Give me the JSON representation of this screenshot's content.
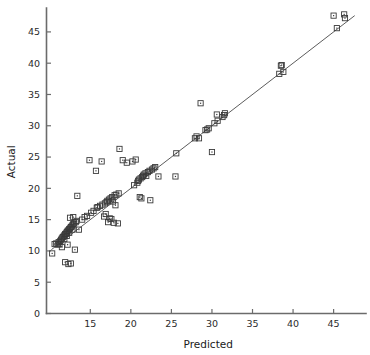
{
  "chart_data": {
    "type": "scatter",
    "title": "",
    "xlabel": "Predicted",
    "ylabel": "Actual",
    "xlim": [
      9.6,
      48.5
    ],
    "ylim": [
      0,
      48.5
    ],
    "xticks": [
      15,
      20,
      25,
      30,
      35,
      40,
      45
    ],
    "yticks": [
      0,
      5,
      10,
      15,
      20,
      25,
      30,
      35,
      40,
      45
    ],
    "xtick_labels": [
      "15",
      "20",
      "25",
      "30",
      "35",
      "40",
      "45"
    ],
    "ytick_labels": [
      "0",
      "5",
      "10",
      "15",
      "20",
      "25",
      "30",
      "35",
      "40",
      "45"
    ],
    "grid": false,
    "legend": null,
    "marker": "open-square-with-center-dot",
    "marker_color": "#3a3a3a",
    "reference_line": {
      "name": "identity-line",
      "type": "line",
      "x": [
        10.2,
        47.6
      ],
      "y": [
        10.2,
        47.6
      ],
      "color": "#4a4a4a"
    },
    "points": [
      {
        "x": 10.3,
        "y": 9.6
      },
      {
        "x": 10.6,
        "y": 11.1
      },
      {
        "x": 10.8,
        "y": 11.2
      },
      {
        "x": 11.0,
        "y": 11.0
      },
      {
        "x": 11.1,
        "y": 11.4
      },
      {
        "x": 11.2,
        "y": 11.1
      },
      {
        "x": 11.3,
        "y": 11.6
      },
      {
        "x": 11.4,
        "y": 11.8
      },
      {
        "x": 11.5,
        "y": 12.0
      },
      {
        "x": 11.5,
        "y": 10.6
      },
      {
        "x": 11.6,
        "y": 12.2
      },
      {
        "x": 11.7,
        "y": 12.3
      },
      {
        "x": 11.8,
        "y": 12.5
      },
      {
        "x": 11.8,
        "y": 11.9
      },
      {
        "x": 11.9,
        "y": 12.7
      },
      {
        "x": 11.9,
        "y": 8.2
      },
      {
        "x": 12.0,
        "y": 12.8
      },
      {
        "x": 12.1,
        "y": 13.0
      },
      {
        "x": 12.1,
        "y": 12.4
      },
      {
        "x": 12.2,
        "y": 13.2
      },
      {
        "x": 12.2,
        "y": 11.0
      },
      {
        "x": 12.3,
        "y": 13.3
      },
      {
        "x": 12.3,
        "y": 7.9
      },
      {
        "x": 12.4,
        "y": 13.5
      },
      {
        "x": 12.4,
        "y": 12.9
      },
      {
        "x": 12.5,
        "y": 13.6
      },
      {
        "x": 12.5,
        "y": 15.3
      },
      {
        "x": 12.6,
        "y": 13.8
      },
      {
        "x": 12.6,
        "y": 8.0
      },
      {
        "x": 12.7,
        "y": 13.9
      },
      {
        "x": 12.8,
        "y": 14.1
      },
      {
        "x": 12.8,
        "y": 13.4
      },
      {
        "x": 12.9,
        "y": 15.4
      },
      {
        "x": 12.9,
        "y": 14.3
      },
      {
        "x": 13.0,
        "y": 14.4
      },
      {
        "x": 13.1,
        "y": 10.2
      },
      {
        "x": 13.2,
        "y": 14.6
      },
      {
        "x": 13.3,
        "y": 14.8
      },
      {
        "x": 13.4,
        "y": 18.8
      },
      {
        "x": 13.6,
        "y": 13.4
      },
      {
        "x": 14.0,
        "y": 15.0
      },
      {
        "x": 14.3,
        "y": 15.4
      },
      {
        "x": 14.6,
        "y": 15.6
      },
      {
        "x": 14.9,
        "y": 24.5
      },
      {
        "x": 15.1,
        "y": 16.1
      },
      {
        "x": 15.4,
        "y": 16.4
      },
      {
        "x": 15.7,
        "y": 22.8
      },
      {
        "x": 15.8,
        "y": 16.9
      },
      {
        "x": 15.9,
        "y": 17.0
      },
      {
        "x": 16.2,
        "y": 17.2
      },
      {
        "x": 16.4,
        "y": 24.3
      },
      {
        "x": 16.5,
        "y": 17.4
      },
      {
        "x": 16.7,
        "y": 15.5
      },
      {
        "x": 16.8,
        "y": 17.6
      },
      {
        "x": 16.9,
        "y": 15.9
      },
      {
        "x": 17.0,
        "y": 17.8
      },
      {
        "x": 17.1,
        "y": 18.0
      },
      {
        "x": 17.2,
        "y": 14.6
      },
      {
        "x": 17.3,
        "y": 18.2
      },
      {
        "x": 17.4,
        "y": 15.2
      },
      {
        "x": 17.5,
        "y": 18.4
      },
      {
        "x": 17.6,
        "y": 15.1
      },
      {
        "x": 17.7,
        "y": 18.6
      },
      {
        "x": 17.8,
        "y": 17.9
      },
      {
        "x": 17.9,
        "y": 14.5
      },
      {
        "x": 18.0,
        "y": 18.9
      },
      {
        "x": 18.1,
        "y": 17.3
      },
      {
        "x": 18.2,
        "y": 19.0
      },
      {
        "x": 18.4,
        "y": 14.4
      },
      {
        "x": 18.5,
        "y": 19.2
      },
      {
        "x": 18.6,
        "y": 26.3
      },
      {
        "x": 19.0,
        "y": 24.5
      },
      {
        "x": 19.5,
        "y": 24.1
      },
      {
        "x": 20.2,
        "y": 24.3
      },
      {
        "x": 20.4,
        "y": 20.5
      },
      {
        "x": 20.6,
        "y": 24.6
      },
      {
        "x": 20.8,
        "y": 20.9
      },
      {
        "x": 20.9,
        "y": 21.2
      },
      {
        "x": 21.0,
        "y": 21.4
      },
      {
        "x": 21.1,
        "y": 18.6
      },
      {
        "x": 21.2,
        "y": 21.6
      },
      {
        "x": 21.3,
        "y": 18.4
      },
      {
        "x": 21.4,
        "y": 21.8
      },
      {
        "x": 21.5,
        "y": 22.0
      },
      {
        "x": 21.6,
        "y": 22.2
      },
      {
        "x": 21.8,
        "y": 22.4
      },
      {
        "x": 21.9,
        "y": 22.0
      },
      {
        "x": 22.1,
        "y": 22.6
      },
      {
        "x": 22.3,
        "y": 22.8
      },
      {
        "x": 22.4,
        "y": 18.1
      },
      {
        "x": 22.6,
        "y": 23.0
      },
      {
        "x": 22.8,
        "y": 23.2
      },
      {
        "x": 23.0,
        "y": 23.4
      },
      {
        "x": 23.4,
        "y": 21.9
      },
      {
        "x": 25.5,
        "y": 21.9
      },
      {
        "x": 25.6,
        "y": 25.6
      },
      {
        "x": 27.9,
        "y": 28.0
      },
      {
        "x": 28.1,
        "y": 28.3
      },
      {
        "x": 28.4,
        "y": 28.0
      },
      {
        "x": 28.6,
        "y": 33.6
      },
      {
        "x": 29.2,
        "y": 29.3
      },
      {
        "x": 29.4,
        "y": 29.4
      },
      {
        "x": 29.6,
        "y": 29.6
      },
      {
        "x": 30.0,
        "y": 25.8
      },
      {
        "x": 30.3,
        "y": 30.4
      },
      {
        "x": 30.6,
        "y": 31.8
      },
      {
        "x": 30.7,
        "y": 30.8
      },
      {
        "x": 31.3,
        "y": 31.4
      },
      {
        "x": 31.5,
        "y": 31.7
      },
      {
        "x": 31.6,
        "y": 32.0
      },
      {
        "x": 38.3,
        "y": 38.3
      },
      {
        "x": 38.5,
        "y": 39.6
      },
      {
        "x": 38.6,
        "y": 39.7
      },
      {
        "x": 38.8,
        "y": 38.6
      },
      {
        "x": 45.0,
        "y": 47.6
      },
      {
        "x": 45.4,
        "y": 45.6
      },
      {
        "x": 46.3,
        "y": 47.8
      },
      {
        "x": 46.4,
        "y": 47.2
      }
    ]
  }
}
